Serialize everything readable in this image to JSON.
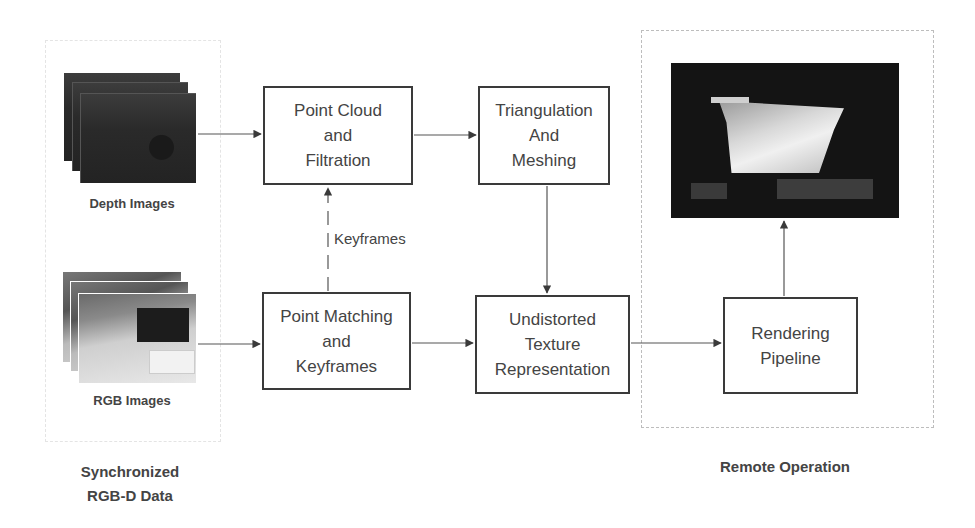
{
  "diagram": {
    "groups": {
      "left": {
        "caption_line1": "Synchronized",
        "caption_line2": "RGB-D Data"
      },
      "right": {
        "caption": "Remote Operation"
      }
    },
    "inputs": {
      "depth": {
        "label": "Depth Images",
        "icon": "image-stack-icon"
      },
      "rgb": {
        "label": "RGB Images",
        "icon": "image-stack-icon"
      }
    },
    "nodes": {
      "point_cloud": {
        "line1": "Point Cloud",
        "line2": "and",
        "line3": "Filtration"
      },
      "triangulation": {
        "line1": "Triangulation",
        "line2": "And",
        "line3": "Meshing"
      },
      "point_matching": {
        "line1": "Point Matching",
        "line2": "and",
        "line3": "Keyframes"
      },
      "texture": {
        "line1": "Undistorted",
        "line2": "Texture",
        "line3": "Representation"
      },
      "rendering": {
        "line1": "Rendering",
        "line2": "Pipeline"
      }
    },
    "edges": [
      {
        "from": "Depth Images",
        "to": "Point Cloud and Filtration",
        "style": "solid"
      },
      {
        "from": "Point Cloud and Filtration",
        "to": "Triangulation And Meshing",
        "style": "solid"
      },
      {
        "from": "RGB Images",
        "to": "Point Matching and Keyframes",
        "style": "solid"
      },
      {
        "from": "Point Matching and Keyframes",
        "to": "Point Cloud and Filtration",
        "style": "dashed",
        "label": "Keyframes"
      },
      {
        "from": "Triangulation And Meshing",
        "to": "Undistorted Texture Representation",
        "style": "solid"
      },
      {
        "from": "Point Matching and Keyframes",
        "to": "Undistorted Texture Representation",
        "style": "solid"
      },
      {
        "from": "Undistorted Texture Representation",
        "to": "Rendering Pipeline",
        "style": "solid"
      },
      {
        "from": "Rendering Pipeline",
        "to": "Rendered View",
        "style": "solid"
      }
    ],
    "edge_labels": {
      "keyframes": "Keyframes"
    },
    "colors": {
      "stroke": "#3a3a3a",
      "text": "#444444",
      "dashed_border": "#bdbdbd"
    }
  }
}
